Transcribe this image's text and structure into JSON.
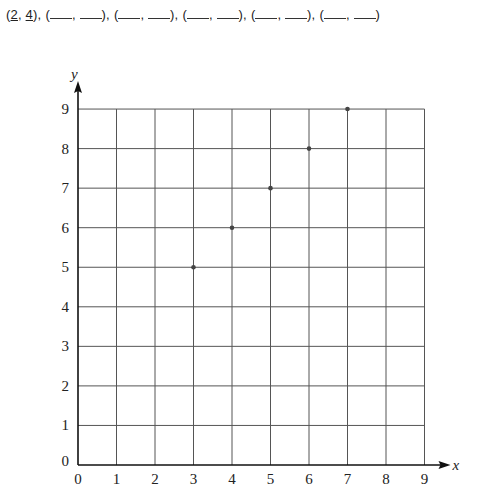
{
  "header": {
    "pairs": [
      {
        "x": "2",
        "y": "4",
        "filled": true
      },
      {
        "x": "",
        "y": "",
        "filled": false
      },
      {
        "x": "",
        "y": "",
        "filled": false
      },
      {
        "x": "",
        "y": "",
        "filled": false
      },
      {
        "x": "",
        "y": "",
        "filled": false
      },
      {
        "x": "",
        "y": "",
        "filled": false
      }
    ]
  },
  "chart_data": {
    "type": "scatter",
    "title": "",
    "xlabel": "x",
    "ylabel": "y",
    "xlim": [
      0,
      9
    ],
    "ylim": [
      0,
      9
    ],
    "grid": true,
    "x_ticks": [
      "0",
      "1",
      "2",
      "3",
      "4",
      "5",
      "6",
      "7",
      "8",
      "9"
    ],
    "y_ticks": [
      "0",
      "1",
      "2",
      "3",
      "4",
      "5",
      "6",
      "7",
      "8",
      "9"
    ],
    "points": [
      {
        "x": 3,
        "y": 5
      },
      {
        "x": 4,
        "y": 6
      },
      {
        "x": 5,
        "y": 7
      },
      {
        "x": 6,
        "y": 8
      },
      {
        "x": 7,
        "y": 9
      }
    ],
    "colors": {
      "grid": "#555555",
      "axis": "#111111",
      "point": "#444444"
    }
  }
}
